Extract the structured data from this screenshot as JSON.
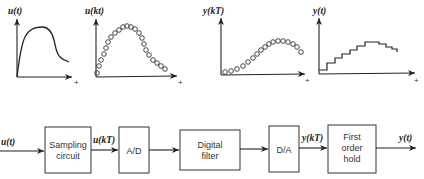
{
  "plots": [
    {
      "label": "u(t)",
      "axis_end": "+",
      "type": "continuous-curve"
    },
    {
      "label": "u(kt)",
      "axis_end": "+",
      "type": "sampled-circles"
    },
    {
      "label": "y(kT)",
      "axis_end": "+",
      "type": "sampled-circles"
    },
    {
      "label": "y(t)",
      "axis_end": "+",
      "type": "staircase"
    }
  ],
  "block_diagram": {
    "input_label": "u(t)",
    "blocks": [
      {
        "lines": [
          "Sampling",
          "circuit"
        ]
      },
      {
        "lines": [
          "A/D"
        ]
      },
      {
        "lines": [
          "Digital",
          "filter"
        ]
      },
      {
        "lines": [
          "D/A"
        ]
      },
      {
        "lines": [
          "First",
          "order",
          "hold"
        ]
      }
    ],
    "signal_labels": {
      "after_sampling": "u(kT)",
      "after_da": "y(kT)",
      "output": "y(t)"
    }
  },
  "colors": {
    "ink": "#222222",
    "background": "#ffffff"
  }
}
